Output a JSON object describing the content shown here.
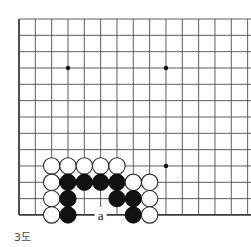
{
  "diagram": {
    "caption": "3도",
    "type": "go-board-diagram",
    "board": {
      "columns": 13,
      "rows": 13,
      "origin_x": 19,
      "origin_y": 19,
      "spacing": 16.33,
      "line_color": "#4d4d4d",
      "edge_color": "#3a3a3a",
      "background": "#ffffff",
      "star_points": [
        {
          "col": 3,
          "row": 3
        },
        {
          "col": 9,
          "row": 3
        },
        {
          "col": 9,
          "row": 9
        }
      ]
    },
    "stones": [
      {
        "color": "white",
        "col": 2,
        "row": 9
      },
      {
        "color": "white",
        "col": 3,
        "row": 9
      },
      {
        "color": "white",
        "col": 4,
        "row": 9
      },
      {
        "color": "white",
        "col": 5,
        "row": 9
      },
      {
        "color": "white",
        "col": 6,
        "row": 9
      },
      {
        "color": "white",
        "col": 2,
        "row": 10
      },
      {
        "color": "black",
        "col": 3,
        "row": 10
      },
      {
        "color": "black",
        "col": 4,
        "row": 10
      },
      {
        "color": "black",
        "col": 5,
        "row": 10
      },
      {
        "color": "black",
        "col": 6,
        "row": 10
      },
      {
        "color": "white",
        "col": 7,
        "row": 10
      },
      {
        "color": "white",
        "col": 8,
        "row": 10
      },
      {
        "color": "white",
        "col": 2,
        "row": 11
      },
      {
        "color": "black",
        "col": 3,
        "row": 11
      },
      {
        "color": "black",
        "col": 6,
        "row": 11
      },
      {
        "color": "black",
        "col": 7,
        "row": 11
      },
      {
        "color": "white",
        "col": 8,
        "row": 11
      },
      {
        "color": "white",
        "col": 2,
        "row": 12
      },
      {
        "color": "black",
        "col": 3,
        "row": 12
      },
      {
        "color": "black",
        "col": 7,
        "row": 12
      },
      {
        "color": "white",
        "col": 8,
        "row": 12
      }
    ],
    "markers": [
      {
        "label": "a",
        "col": 5,
        "row": 12
      }
    ],
    "colors": {
      "black_stone_fill": "#111111",
      "black_stone_stroke": "#000000",
      "white_stone_fill": "#ffffff",
      "white_stone_stroke": "#2b2b2b",
      "caption_color": "#4a4a4a",
      "marker_color": "#1a1a1a"
    },
    "stone_radius": 8.2
  }
}
